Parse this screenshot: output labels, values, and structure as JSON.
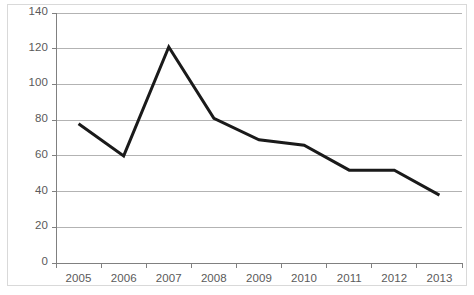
{
  "chart_data": {
    "type": "line",
    "title": "",
    "subtitle": "",
    "xlabel": "",
    "ylabel": "",
    "categories": [
      "2005",
      "2006",
      "2007",
      "2008",
      "2009",
      "2010",
      "2011",
      "2012",
      "2013"
    ],
    "series": [
      {
        "name": "",
        "values": [
          78,
          60,
          121,
          81,
          69,
          66,
          52,
          52,
          38
        ],
        "color": "#1a1a1a",
        "line_width": 3,
        "markers": false
      }
    ],
    "ylim": [
      0,
      140
    ],
    "y_ticks": [
      0,
      20,
      40,
      60,
      80,
      100,
      120,
      140
    ],
    "y_tick_labels": [
      "0",
      "20",
      "40",
      "60",
      "80",
      "100",
      "120",
      "140"
    ],
    "x_tick_labels": [
      "2005",
      "2006",
      "2007",
      "2008",
      "2009",
      "2010",
      "2011",
      "2012",
      "2013"
    ],
    "grid": {
      "horizontal": true,
      "vertical": false,
      "color": "#b3b3b3"
    },
    "legend": {
      "visible": false,
      "position": "none",
      "entries": []
    },
    "axis": {
      "y_axis_line_color": "#808080",
      "x_axis_line_color": "#808080",
      "tick_mark_color": "#808080",
      "label_color": "#5a5a5a"
    },
    "annotations": [],
    "background_color": "#ffffff",
    "frame_color": "#d9d9d9"
  }
}
